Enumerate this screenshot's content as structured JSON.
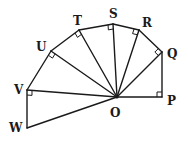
{
  "diagram": {
    "type": "geometry",
    "center": {
      "label": "O",
      "x": 117,
      "y": 97,
      "label_x": 110,
      "label_y": 117
    },
    "points": [
      {
        "label": "P",
        "x": 162,
        "y": 97,
        "label_x": 167,
        "label_y": 105
      },
      {
        "label": "Q",
        "x": 162,
        "y": 52,
        "label_x": 167,
        "label_y": 58
      },
      {
        "label": "R",
        "x": 139,
        "y": 30,
        "label_x": 142,
        "label_y": 27
      },
      {
        "label": "S",
        "x": 113,
        "y": 24,
        "label_x": 109,
        "label_y": 18
      },
      {
        "label": "T",
        "x": 79,
        "y": 30,
        "label_x": 73,
        "label_y": 25
      },
      {
        "label": "U",
        "x": 51,
        "y": 51,
        "label_x": 36,
        "label_y": 51
      },
      {
        "label": "V",
        "x": 27,
        "y": 90,
        "label_x": 14,
        "label_y": 94
      },
      {
        "label": "W",
        "x": 27,
        "y": 128,
        "label_x": 9,
        "label_y": 132
      }
    ],
    "right_angles_at": [
      "P",
      "Q",
      "R",
      "S",
      "T",
      "U",
      "V"
    ],
    "stroke_color": "#1a1a1a",
    "background": "#ffffff"
  }
}
